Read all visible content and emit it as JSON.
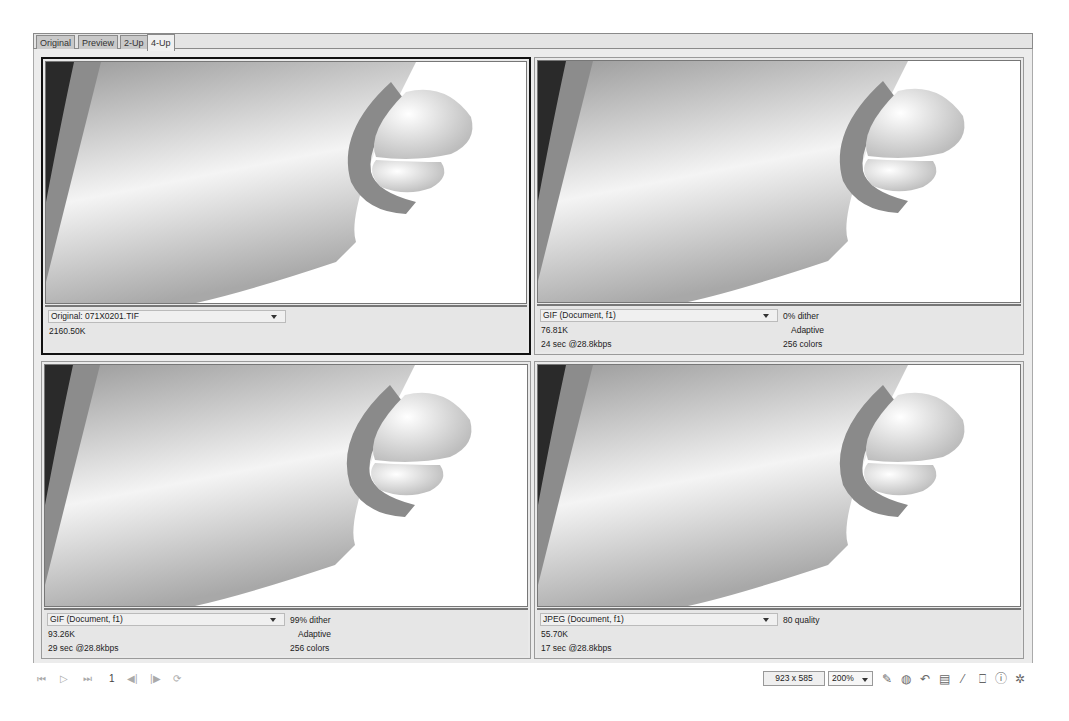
{
  "tabs": [
    {
      "label": "Original",
      "active": false
    },
    {
      "label": "Preview",
      "active": false
    },
    {
      "label": "2-Up",
      "active": false
    },
    {
      "label": "4-Up",
      "active": true
    }
  ],
  "panels": [
    {
      "id": "original",
      "selected": true,
      "format": "Original: 071X0201.TIF",
      "size": "2160.50K",
      "time": "",
      "option1": "",
      "option2": "",
      "option3": ""
    },
    {
      "id": "gif-0-dither",
      "selected": false,
      "format": "GIF (Document, f1)",
      "size": "76.81K",
      "time": "24 sec @28.8kbps",
      "option1": "0% dither",
      "option2": "Adaptive",
      "option3": "256 colors"
    },
    {
      "id": "gif-99-dither",
      "selected": false,
      "format": "GIF (Document, f1)",
      "size": "93.26K",
      "time": "29 sec @28.8kbps",
      "option1": "99% dither",
      "option2": "Adaptive",
      "option3": "256 colors"
    },
    {
      "id": "jpeg-80",
      "selected": false,
      "format": "JPEG (Document, f1)",
      "size": "55.70K",
      "time": "17 sec @28.8kbps",
      "option1": "80 quality",
      "option2": "",
      "option3": ""
    }
  ],
  "bottombar": {
    "nav": {
      "first": "⏮",
      "play": "▷",
      "last": "⏭",
      "frame": "1",
      "prev": "◀|",
      "next": "|▶",
      "loop": "⟳"
    },
    "dimensions": "923 x 585",
    "zoom": "200%",
    "tools": [
      {
        "name": "pencil-icon",
        "glyph": "✎"
      },
      {
        "name": "palette-icon",
        "glyph": "◍"
      },
      {
        "name": "undo-icon",
        "glyph": "↶"
      },
      {
        "name": "layers-icon",
        "glyph": "▤"
      },
      {
        "name": "eyedropper-icon",
        "glyph": "⁄"
      },
      {
        "name": "book-icon",
        "glyph": "⎕"
      },
      {
        "name": "info-icon",
        "glyph": "ⓘ"
      },
      {
        "name": "settings-icon",
        "glyph": "✲"
      }
    ]
  },
  "colors": {
    "panel_bg": "#e9e9e9",
    "selected_border": "#111111",
    "gray_band": "#8c8c8c",
    "dark_region": "#2a2a2a"
  }
}
